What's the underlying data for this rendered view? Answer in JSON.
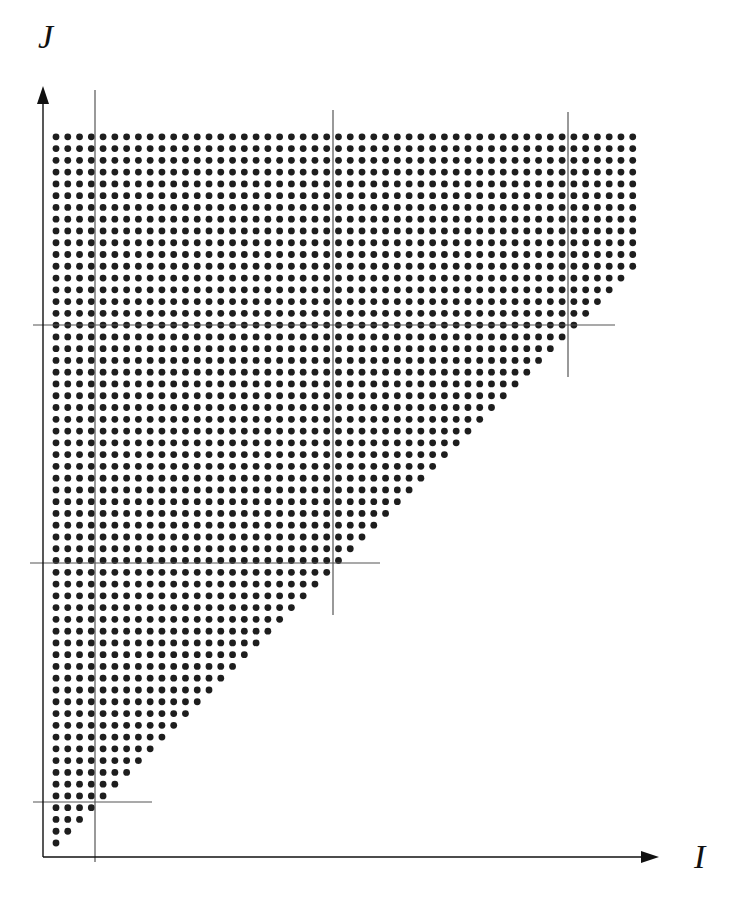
{
  "diagram": {
    "type": "iteration-space-tiling",
    "axes": {
      "x_label": "I",
      "y_label": "J"
    },
    "colors": {
      "dot": "#1e1e1e",
      "axis": "#111111",
      "tile_line": "#555555",
      "background": "#ffffff"
    },
    "grid": {
      "columns": 50,
      "rows": 61,
      "shape": "triangular-clipped",
      "rule": "row k from bottom (k=0..60) contains min(k+1, 50) points starting at I=0",
      "origin_px": [
        56,
        843
      ],
      "pitch_px": 11.77,
      "dot_radius_px": 3.4
    },
    "tile_lines": {
      "vertical": [
        {
          "x": 95,
          "y1": 90,
          "y2": 862
        },
        {
          "x": 333,
          "y1": 110,
          "y2": 615
        },
        {
          "x": 568,
          "y1": 112,
          "y2": 377
        }
      ],
      "horizontal": [
        {
          "y": 325,
          "x1": 33,
          "x2": 615
        },
        {
          "y": 563,
          "x1": 30,
          "x2": 380
        },
        {
          "y": 802,
          "x1": 33,
          "x2": 152
        }
      ]
    }
  }
}
